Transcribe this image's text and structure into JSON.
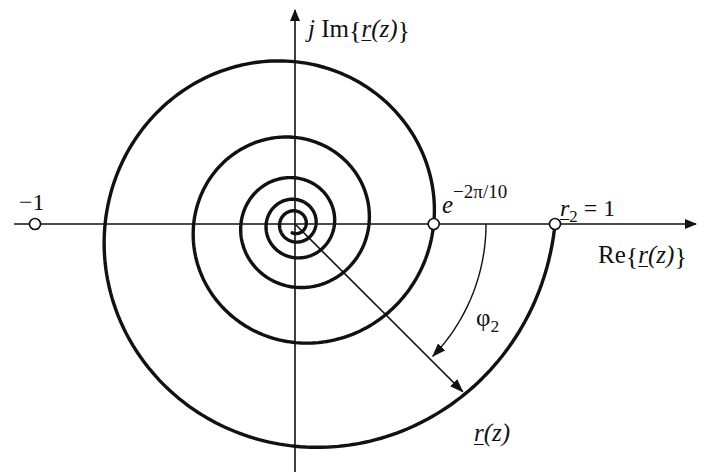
{
  "diagram": {
    "type": "logarithmic-spiral-complex-plane",
    "colors": {
      "stroke": "#111111",
      "background": "#ffffff",
      "marker_fill": "#ffffff"
    },
    "geometry": {
      "origin_px": [
        295,
        224
      ],
      "unit_radius_px": 260,
      "spiral_formula": "r(phi) = exp(phi/10), phi from 0 down to negative, clockwise",
      "decay_per_radian": 0.1,
      "turns": 5.3
    },
    "axes": {
      "real": {
        "label_prefix": "Re",
        "label_func": "r",
        "label_arg": "(z)"
      },
      "imag": {
        "label_j": "j",
        "label_prefix": "Im",
        "label_func": "r",
        "label_arg": "(z)"
      }
    },
    "points": [
      {
        "name": "minus-one",
        "label": "−1",
        "value": -1
      },
      {
        "name": "e-minus-2pi-over-10",
        "label_base": "e",
        "label_exp": "−2π/10",
        "value": 0.5335
      },
      {
        "name": "r2-equals-one",
        "label_var": "r",
        "label_sub": "2",
        "label_rest": " = 1",
        "value": 1
      }
    ],
    "annotations": {
      "angle_label_base": "φ",
      "angle_label_sub": "2",
      "angle_deg": -45,
      "vector_label_func": "r",
      "vector_label_arg": "(z)"
    }
  }
}
